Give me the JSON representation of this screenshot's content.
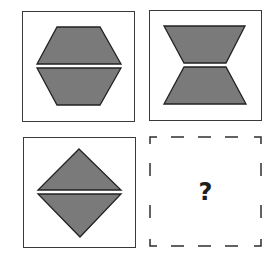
{
  "puzzle": {
    "type": "visual-analogy-2x2",
    "panels": [
      {
        "id": "top-left",
        "shape": "hexagon",
        "description": "hexagon split horizontally into two trapezoids",
        "style": "solid"
      },
      {
        "id": "top-right",
        "shape": "hourglass",
        "description": "two trapezoids narrow ends meeting in the middle",
        "style": "solid"
      },
      {
        "id": "bottom-left",
        "shape": "diamond",
        "description": "diamond split horizontally into two triangles",
        "style": "solid"
      },
      {
        "id": "bottom-right",
        "shape": "unknown",
        "description": "answer slot",
        "style": "dashed",
        "label": "?"
      }
    ],
    "colors": {
      "fill": "#7a7a7a",
      "stroke": "#222222",
      "border": "#3a3a3a",
      "background": "#ffffff"
    }
  }
}
